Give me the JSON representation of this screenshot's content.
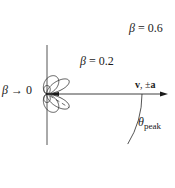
{
  "colors": {
    "stroke": "#2a2a2a",
    "background": "#ffffff"
  },
  "origin": {
    "x": 47,
    "y": 94
  },
  "axis": {
    "label": "v, ±a",
    "label_v": "v",
    "label_sep": ", ±",
    "label_a": "a",
    "x_end": 168,
    "vertical_top": 45,
    "vertical_bottom": 145
  },
  "lobes": [
    {
      "beta": 0.0,
      "label": "β → 0",
      "label_symbol": "β",
      "label_rest": " → 0",
      "scale": 8.5
    },
    {
      "beta": 0.2,
      "label": "β = 0.2",
      "label_symbol": "β",
      "label_rest": " = 0.2",
      "scale": 15.5
    },
    {
      "beta": 0.6,
      "label": "β = 0.6",
      "label_symbol": "β",
      "label_rest": " = 0.6",
      "scale": 2.62
    }
  ],
  "peak_angle": {
    "label_symbol": "θ",
    "label_sub": "peak",
    "arc_radius": 95
  }
}
